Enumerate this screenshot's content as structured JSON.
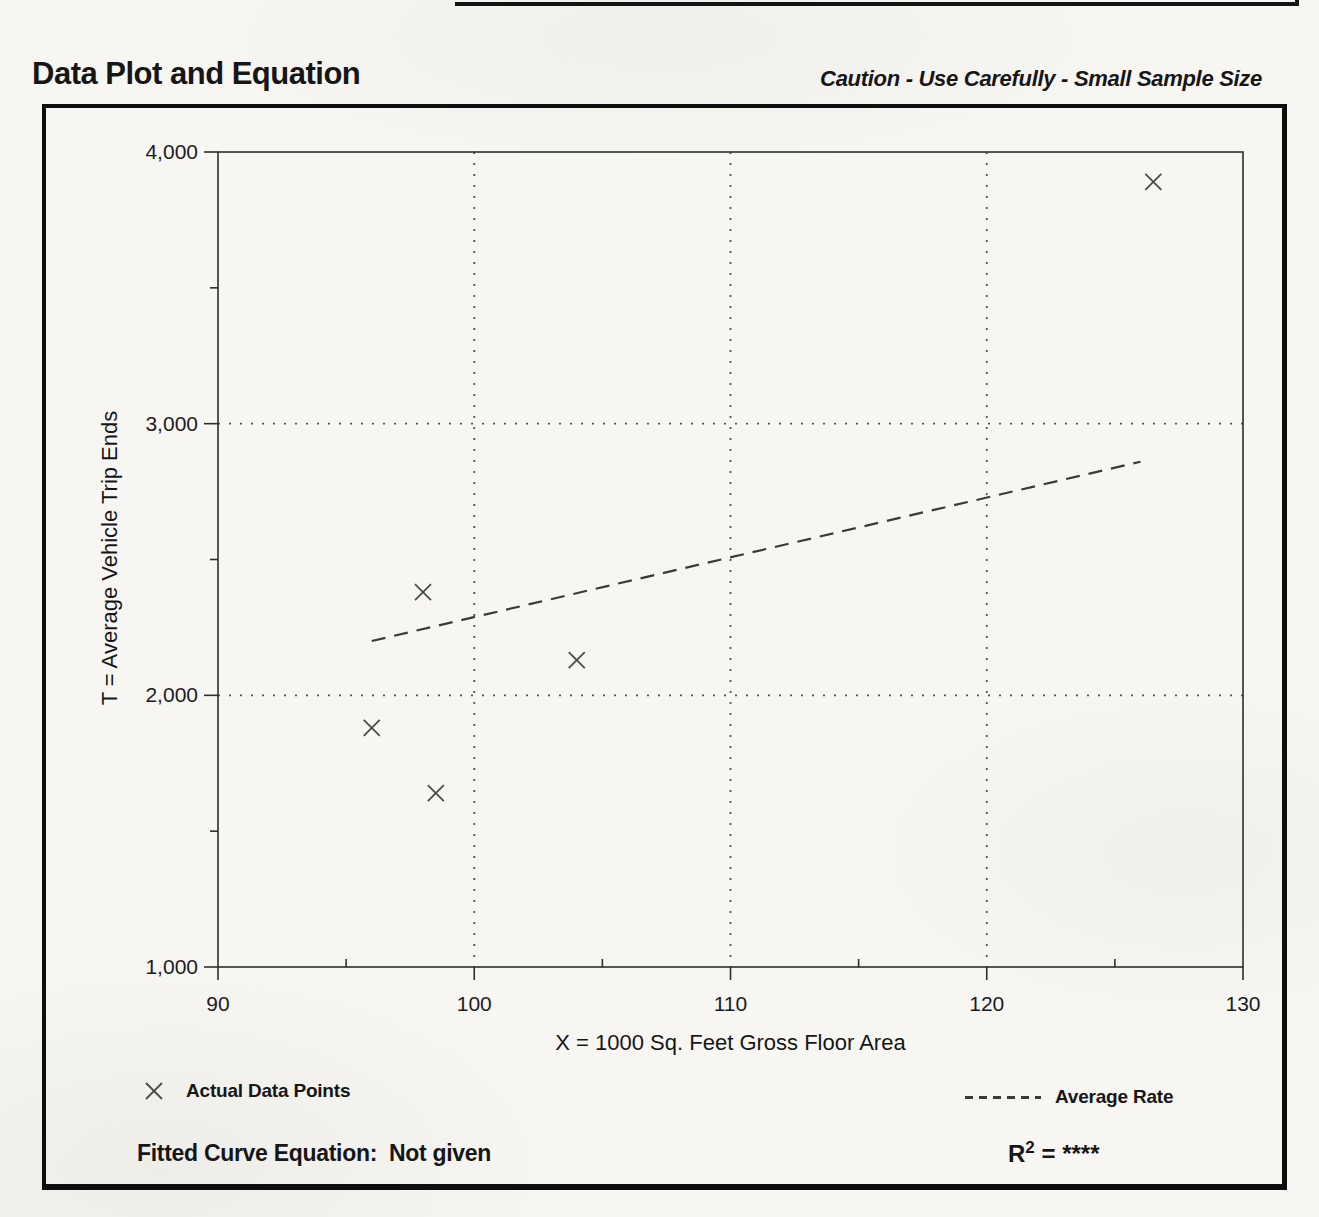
{
  "page": {
    "title": "Data Plot and Equation",
    "caution": "Caution - Use Carefully - Small Sample Size"
  },
  "chart_data": {
    "type": "scatter",
    "title": "Data Plot and Equation",
    "x_axis": {
      "label": "X = 1000 Sq. Feet Gross Floor Area",
      "min": 90,
      "max": 130,
      "major_ticks": [
        90,
        100,
        110,
        120,
        130
      ],
      "tick_labels": [
        "90",
        "100",
        "110",
        "120",
        "130"
      ],
      "minor_ticks": [
        95,
        105,
        115,
        125
      ],
      "gridlines": [
        100,
        110,
        120
      ]
    },
    "y_axis": {
      "label": "T = Average Vehicle Trip Ends",
      "min": 1000,
      "max": 4000,
      "major_ticks": [
        1000,
        2000,
        3000,
        4000
      ],
      "tick_labels": [
        "1,000",
        "2,000",
        "3,000",
        "4,000"
      ],
      "minor_ticks": [
        1500,
        2500,
        3500
      ],
      "gridlines": [
        2000,
        3000
      ]
    },
    "grid": "dotted",
    "series": [
      {
        "name": "Actual Data Points",
        "kind": "scatter",
        "marker": "x",
        "points": [
          [
            96,
            1880
          ],
          [
            98,
            2380
          ],
          [
            98.5,
            1640
          ],
          [
            104,
            2130
          ],
          [
            126.5,
            3890
          ]
        ]
      },
      {
        "name": "Average Rate",
        "kind": "line",
        "style": "dashed",
        "points": [
          [
            96,
            2200
          ],
          [
            126,
            2860
          ]
        ]
      }
    ],
    "legend": [
      {
        "marker": "x",
        "label": "Actual Data Points"
      },
      {
        "marker": "dashed-line",
        "label": "Average Rate"
      }
    ],
    "legend_position": "below"
  },
  "footer": {
    "equation_label": "Fitted Curve Equation:",
    "equation_value": "Not given",
    "r_base": "R",
    "r_exp": "2",
    "r_equals": " = ",
    "r_value": "****"
  }
}
